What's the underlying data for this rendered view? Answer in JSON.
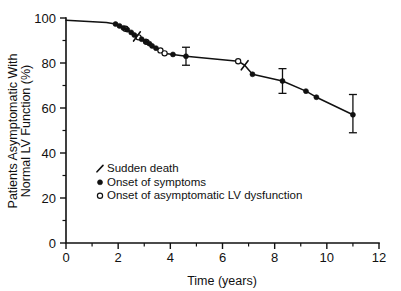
{
  "chart_data": {
    "type": "line",
    "title": "",
    "subtitle": "",
    "xlabel": "Time (years)",
    "ylabel_line1": "Patients Asymptomatic With",
    "ylabel_line2": "Normal LV Function (%)",
    "xlim": [
      0,
      12
    ],
    "ylim": [
      0,
      100
    ],
    "grid": false,
    "x_ticks_major": [
      0,
      2,
      4,
      6,
      8,
      10,
      12
    ],
    "x_ticks_major_labels": [
      "0",
      "2",
      "4",
      "6",
      "8",
      "10",
      "12"
    ],
    "x_ticks_minor": [
      1,
      3,
      5,
      7,
      9,
      11
    ],
    "y_ticks_major": [
      0,
      20,
      40,
      60,
      80,
      100
    ],
    "y_ticks_major_labels": [
      "0",
      "20",
      "40",
      "60",
      "80",
      "100"
    ],
    "y_ticks_minor": [
      10,
      30,
      50,
      70,
      90
    ],
    "legend_position": "inside-lower-left",
    "series": [
      {
        "name": "Survival curve",
        "marker": "line",
        "x": [
          0.0,
          1.55,
          1.9,
          2.05,
          2.2,
          2.35,
          2.5,
          2.62,
          2.75,
          2.9,
          3.05,
          3.2,
          3.3,
          3.45,
          3.6,
          3.75,
          4.1,
          4.6,
          6.6,
          6.85,
          7.15,
          8.3,
          9.2,
          9.6,
          11.0
        ],
        "y": [
          99.0,
          98.0,
          97.3,
          96.5,
          95.6,
          94.8,
          93.6,
          92.4,
          91.4,
          90.6,
          89.6,
          88.6,
          87.6,
          86.6,
          85.6,
          84.3,
          83.8,
          83.0,
          80.8,
          79.0,
          75.0,
          72.0,
          67.5,
          64.8,
          57.0
        ]
      }
    ],
    "points_onset_symptoms": {
      "label": "Onset of symptoms",
      "marker": "filled-circle",
      "x": [
        1.9,
        2.05,
        2.2,
        2.35,
        2.5,
        2.62,
        2.9,
        3.05,
        3.2,
        3.3,
        3.45,
        4.1,
        4.6,
        7.15,
        8.3,
        9.2,
        9.6,
        11.0
      ],
      "y": [
        97.3,
        96.5,
        95.6,
        94.8,
        93.6,
        92.4,
        90.6,
        89.6,
        88.6,
        87.6,
        86.6,
        83.8,
        83.0,
        75.0,
        72.0,
        67.5,
        64.8,
        57.0
      ]
    },
    "points_onset_lv_dysfunction": {
      "label": "Onset of asymptomatic LV dysfunction",
      "marker": "open-circle",
      "x": [
        2.28,
        2.78,
        3.08,
        3.62,
        3.78,
        6.6
      ],
      "y": [
        95.2,
        91.4,
        89.4,
        85.6,
        84.3,
        80.8
      ]
    },
    "points_sudden_death": {
      "label": "Sudden death",
      "marker": "slash",
      "x": [
        2.72,
        6.85
      ],
      "y": [
        91.8,
        79.0
      ]
    },
    "error_bars": [
      {
        "x": 4.6,
        "y": 83.0,
        "low": 79.0,
        "high": 87.0
      },
      {
        "x": 8.3,
        "y": 72.0,
        "low": 66.5,
        "high": 77.5
      },
      {
        "x": 11.0,
        "y": 57.0,
        "low": 49.0,
        "high": 66.0
      }
    ]
  },
  "legend": {
    "items": [
      {
        "label": "Sudden death",
        "marker": "slash"
      },
      {
        "label": "Onset of symptoms",
        "marker": "filled-circle"
      },
      {
        "label": "Onset of asymptomatic LV dysfunction",
        "marker": "open-circle"
      }
    ]
  },
  "colors": {
    "foreground": "#111111",
    "background": "#ffffff"
  }
}
